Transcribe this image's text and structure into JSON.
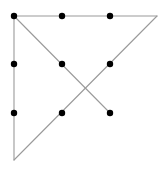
{
  "diagram": {
    "width": 164,
    "height": 169,
    "background": "#ffffff",
    "dot_color": "#000000",
    "dot_radius": 3.2,
    "line_color": "#9a9a9a",
    "line_width": 1.1,
    "dots": [
      {
        "row": 0,
        "col": 0,
        "x": 14,
        "y": 16
      },
      {
        "row": 0,
        "col": 1,
        "x": 62,
        "y": 16
      },
      {
        "row": 0,
        "col": 2,
        "x": 110,
        "y": 16
      },
      {
        "row": 1,
        "col": 0,
        "x": 14,
        "y": 64
      },
      {
        "row": 1,
        "col": 1,
        "x": 62,
        "y": 64
      },
      {
        "row": 1,
        "col": 2,
        "x": 110,
        "y": 64
      },
      {
        "row": 2,
        "col": 0,
        "x": 14,
        "y": 113
      },
      {
        "row": 2,
        "col": 1,
        "x": 62,
        "y": 113
      },
      {
        "row": 2,
        "col": 2,
        "x": 110,
        "y": 113
      }
    ],
    "path": [
      {
        "x": 110,
        "y": 113
      },
      {
        "x": 14,
        "y": 16
      },
      {
        "x": 157,
        "y": 16
      },
      {
        "x": 14,
        "y": 160
      },
      {
        "x": 14,
        "y": 16
      }
    ],
    "segments_count": 4
  }
}
